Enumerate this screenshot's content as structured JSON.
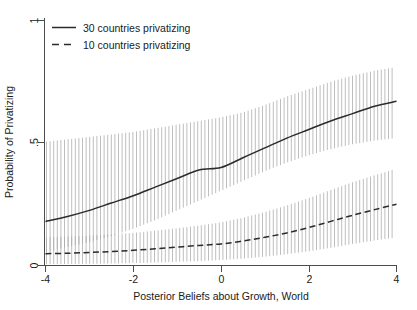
{
  "chart_data": {
    "type": "line",
    "title": "",
    "xlabel": "Posterior Beliefs about Growth, World",
    "ylabel": "Probability of Privatizing",
    "xlim": [
      -4,
      4
    ],
    "ylim": [
      0,
      1
    ],
    "xticks": [
      -4,
      -2,
      0,
      2,
      4
    ],
    "xticklabels": [
      "-4",
      "-2",
      "0",
      "2",
      "4"
    ],
    "yticks": [
      0,
      0.5,
      1
    ],
    "yticklabels": [
      "0",
      ".5",
      "1"
    ],
    "grid": false,
    "legend_position": "top-left",
    "confidence_interval_style": "vertical-hatched-band",
    "x": [
      -4,
      -3.5,
      -3,
      -2.5,
      -2,
      -1.5,
      -1,
      -0.5,
      0,
      0.5,
      1,
      1.5,
      2,
      2.5,
      3,
      3.5,
      4
    ],
    "series": [
      {
        "name": "30 countries privatizing",
        "linestyle": "solid",
        "values": [
          0.18,
          0.2,
          0.225,
          0.255,
          0.285,
          0.32,
          0.355,
          0.39,
          0.4,
          0.44,
          0.48,
          0.52,
          0.555,
          0.59,
          0.62,
          0.65,
          0.67
        ],
        "ci_lower": [
          0.055,
          0.075,
          0.095,
          0.12,
          0.15,
          0.185,
          0.225,
          0.265,
          0.305,
          0.345,
          0.385,
          0.42,
          0.45,
          0.475,
          0.495,
          0.51,
          0.52
        ],
        "ci_upper": [
          0.505,
          0.515,
          0.525,
          0.535,
          0.545,
          0.56,
          0.575,
          0.59,
          0.605,
          0.625,
          0.655,
          0.69,
          0.72,
          0.75,
          0.775,
          0.795,
          0.81
        ]
      },
      {
        "name": "10 countries privatizing",
        "linestyle": "dashed",
        "values": [
          0.048,
          0.05,
          0.053,
          0.057,
          0.062,
          0.068,
          0.075,
          0.082,
          0.088,
          0.1,
          0.115,
          0.133,
          0.155,
          0.18,
          0.205,
          0.228,
          0.25
        ],
        "ci_lower": [
          0.005,
          0.006,
          0.007,
          0.008,
          0.01,
          0.012,
          0.015,
          0.018,
          0.022,
          0.028,
          0.036,
          0.046,
          0.058,
          0.072,
          0.088,
          0.102,
          0.115
        ],
        "ci_upper": [
          0.115,
          0.118,
          0.122,
          0.127,
          0.133,
          0.142,
          0.152,
          0.163,
          0.176,
          0.195,
          0.218,
          0.245,
          0.275,
          0.308,
          0.34,
          0.368,
          0.395
        ]
      }
    ]
  },
  "legend": {
    "items": [
      {
        "label": "30 countries privatizing",
        "style": "solid"
      },
      {
        "label": "10 countries privatizing",
        "style": "dashed"
      }
    ]
  },
  "axes": {
    "x_title": "Posterior Beliefs about Growth, World",
    "y_title": "Probability of Privatizing",
    "x_tick_labels": [
      "-4",
      "-2",
      "0",
      "2",
      "4"
    ],
    "y_tick_labels": [
      "0",
      ".5",
      "1"
    ]
  },
  "colors": {
    "line": "#2b2b2b",
    "ci_band": "#a8a8a8",
    "axis": "#4d4d4d",
    "background": "#ffffff",
    "text": "#1a1a1a"
  }
}
